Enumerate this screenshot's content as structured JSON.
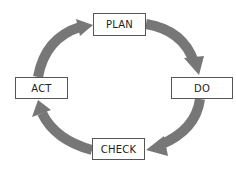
{
  "diagram": {
    "type": "cycle",
    "arrow_color": "#777777",
    "box_border_color": "#555555",
    "text_color": "#222222",
    "steps": [
      {
        "id": "plan",
        "label": "PLAN",
        "x": 93,
        "y": 13,
        "w": 53,
        "h": 23
      },
      {
        "id": "do",
        "label": "DO",
        "x": 171,
        "y": 77,
        "w": 62,
        "h": 22
      },
      {
        "id": "check",
        "label": "CHECK",
        "x": 92,
        "y": 138,
        "w": 53,
        "h": 22
      },
      {
        "id": "act",
        "label": "ACT",
        "x": 15,
        "y": 77,
        "w": 53,
        "h": 22
      }
    ],
    "edges": [
      {
        "from": "PLAN",
        "to": "DO"
      },
      {
        "from": "DO",
        "to": "CHECK"
      },
      {
        "from": "CHECK",
        "to": "ACT"
      },
      {
        "from": "ACT",
        "to": "PLAN"
      }
    ]
  }
}
